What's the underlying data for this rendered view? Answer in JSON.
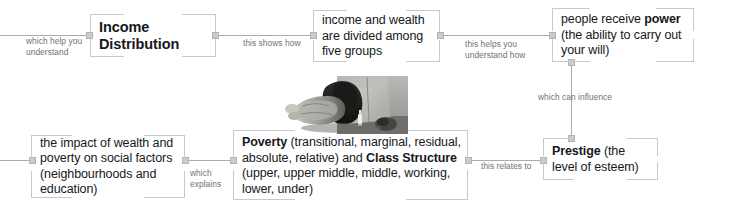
{
  "map": {
    "title": "Income Distribution concept map",
    "nodes": [
      {
        "id": "income-distribution",
        "text": "Income Distribution",
        "style": "title"
      },
      {
        "id": "income-wealth-divided",
        "text": "income and wealth are divided among five groups",
        "style": "plain"
      },
      {
        "id": "people-receive-power",
        "text_parts": [
          {
            "t": "people receive ",
            "bold": false
          },
          {
            "t": "power",
            "bold": true
          },
          {
            "t": " (the ability to carry out your will)",
            "bold": false
          }
        ],
        "style": "plain"
      },
      {
        "id": "prestige",
        "text_parts": [
          {
            "t": "Prestige",
            "bold": true
          },
          {
            "t": " (the level of esteem)",
            "bold": false
          }
        ],
        "style": "plain"
      },
      {
        "id": "poverty-class-structure",
        "text_parts": [
          {
            "t": "Poverty",
            "bold": true
          },
          {
            "t": " (transitional, marginal, residual, absolute, relative) and ",
            "bold": false
          },
          {
            "t": "Class Structure",
            "bold": true
          },
          {
            "t": " (upper, upper middle, middle, working, lower, under)",
            "bold": false
          }
        ],
        "style": "plain"
      },
      {
        "id": "impact-wealth-poverty",
        "text": "the impact of wealth and poverty on social factors (neighbourhoods and education)",
        "style": "plain"
      }
    ],
    "edge_labels": [
      {
        "id": "which-help-you-understand",
        "text": "which help you\nunderstand"
      },
      {
        "id": "this-shows-how",
        "text": "this shows how"
      },
      {
        "id": "this-helps-you-understand-how",
        "text": "this helps you\nunderstand how"
      },
      {
        "id": "which-can-influence",
        "text": "which can influence"
      },
      {
        "id": "this-relates-to",
        "text": "this relates to"
      },
      {
        "id": "which-explains",
        "text": "which\nexplains"
      }
    ],
    "image_caption": "photograph of a person sleeping rough on a street",
    "colors": {
      "node_border": "#c6c9ce",
      "connector": "#a9adb3",
      "anchor_fill": "#c9ccd1",
      "text": "#16181b",
      "edge_label_text": "#6e7277",
      "background": "#ffffff"
    }
  }
}
